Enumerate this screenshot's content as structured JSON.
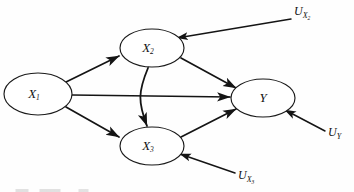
{
  "figure": {
    "type": "causal-path-diagram",
    "background_color": "#fefefe",
    "stroke_color": "#141414",
    "width": 354,
    "height": 192
  },
  "nodes": [
    {
      "id": "x1",
      "name": "X1",
      "base": "X",
      "subscript": "1",
      "shape": "ellipse",
      "cx": 38,
      "cy": 94,
      "rx": 34,
      "ry": 21
    },
    {
      "id": "x2",
      "name": "X2",
      "base": "X",
      "subscript": "2",
      "shape": "ellipse",
      "cx": 152,
      "cy": 48,
      "rx": 32,
      "ry": 19
    },
    {
      "id": "x3",
      "name": "X3",
      "base": "X",
      "subscript": "3",
      "shape": "ellipse",
      "cx": 152,
      "cy": 146,
      "rx": 32,
      "ry": 19
    },
    {
      "id": "y",
      "name": "Y",
      "base": "Y",
      "subscript": "",
      "shape": "ellipse",
      "cx": 263,
      "cy": 98,
      "rx": 32,
      "ry": 19
    }
  ],
  "disturbances": [
    {
      "id": "u_x2",
      "base": "U",
      "subscript": "X",
      "subsubscript": "2",
      "label": "U_X2",
      "x": 299,
      "y": 15,
      "target": "x2"
    },
    {
      "id": "u_y",
      "base": "U",
      "subscript": "Y",
      "subsubscript": "",
      "label": "U_Y",
      "x": 327,
      "y": 135,
      "target": "y"
    },
    {
      "id": "u_x3",
      "base": "U",
      "subscript": "X",
      "subsubscript": "3",
      "label": "U_X3",
      "x": 238,
      "y": 178,
      "target": "x3"
    }
  ],
  "edges": [
    {
      "id": "e-x1-x2",
      "from": "x1",
      "to": "x2",
      "style": "straight",
      "arrow": "single"
    },
    {
      "id": "e-x1-x3",
      "from": "x1",
      "to": "x3",
      "style": "straight",
      "arrow": "single"
    },
    {
      "id": "e-x1-y",
      "from": "x1",
      "to": "y",
      "style": "straight",
      "arrow": "single"
    },
    {
      "id": "e-x2-y",
      "from": "x2",
      "to": "y",
      "style": "straight",
      "arrow": "single"
    },
    {
      "id": "e-x3-y",
      "from": "x3",
      "to": "y",
      "style": "straight",
      "arrow": "single"
    },
    {
      "id": "e-x2-x3",
      "from": "x2",
      "to": "x3",
      "style": "curved",
      "arrow": "double"
    },
    {
      "id": "e-ux2-x2",
      "from": "u_x2",
      "to": "x2",
      "style": "straight",
      "arrow": "single"
    },
    {
      "id": "e-uy-y",
      "from": "u_y",
      "to": "y",
      "style": "straight",
      "arrow": "single"
    },
    {
      "id": "e-ux3-x3",
      "from": "u_x3",
      "to": "x3",
      "style": "straight",
      "arrow": "single"
    }
  ]
}
